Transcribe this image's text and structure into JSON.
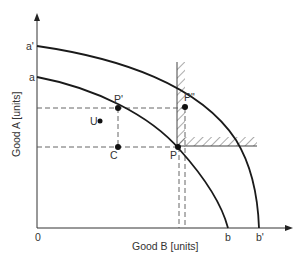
{
  "diagram": {
    "type": "production-possibility-frontier",
    "axes": {
      "x_label": "Good B [units]",
      "y_label": "Good A [units]",
      "origin_label": "0"
    },
    "curves": [
      {
        "name": "inner-ppf",
        "y_intercept_label": "a",
        "x_intercept_label": "b"
      },
      {
        "name": "outer-ppf",
        "y_intercept_label": "a'",
        "x_intercept_label": "b'"
      }
    ],
    "points": {
      "P": "P",
      "P_prime": "P'",
      "P_double_prime": "P\"",
      "C": "C",
      "U": "U"
    },
    "colors": {
      "line": "#1a1a1a",
      "text": "#333333",
      "dashed": "#555555",
      "background": "#ffffff"
    }
  }
}
